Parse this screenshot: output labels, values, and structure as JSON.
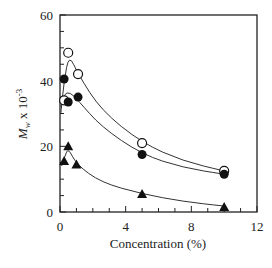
{
  "chart_data": {
    "type": "scatter",
    "title": "",
    "xlabel": "Concentration (%)",
    "ylabel": "M_w x 10^-3",
    "xlim": [
      0,
      12
    ],
    "ylim": [
      0,
      60
    ],
    "xticks": [
      0,
      4,
      8,
      12
    ],
    "yticks": [
      0,
      20,
      40,
      60
    ],
    "grid": false,
    "legend": "none",
    "series": [
      {
        "name": "open circles",
        "marker": "open-circle",
        "x": [
          0.25,
          0.5,
          1.1,
          5,
          10
        ],
        "y": [
          34,
          48.5,
          42,
          21,
          12.5
        ]
      },
      {
        "name": "filled circles",
        "marker": "filled-circle",
        "x": [
          0.25,
          0.5,
          1.1,
          5,
          10
        ],
        "y": [
          40.5,
          33.5,
          35,
          17.5,
          11.5
        ]
      },
      {
        "name": "filled triangles",
        "marker": "filled-triangle",
        "x": [
          0.25,
          0.5,
          1.0,
          5,
          10
        ],
        "y": [
          15.5,
          20,
          14.5,
          5.5,
          1.5
        ]
      }
    ]
  }
}
